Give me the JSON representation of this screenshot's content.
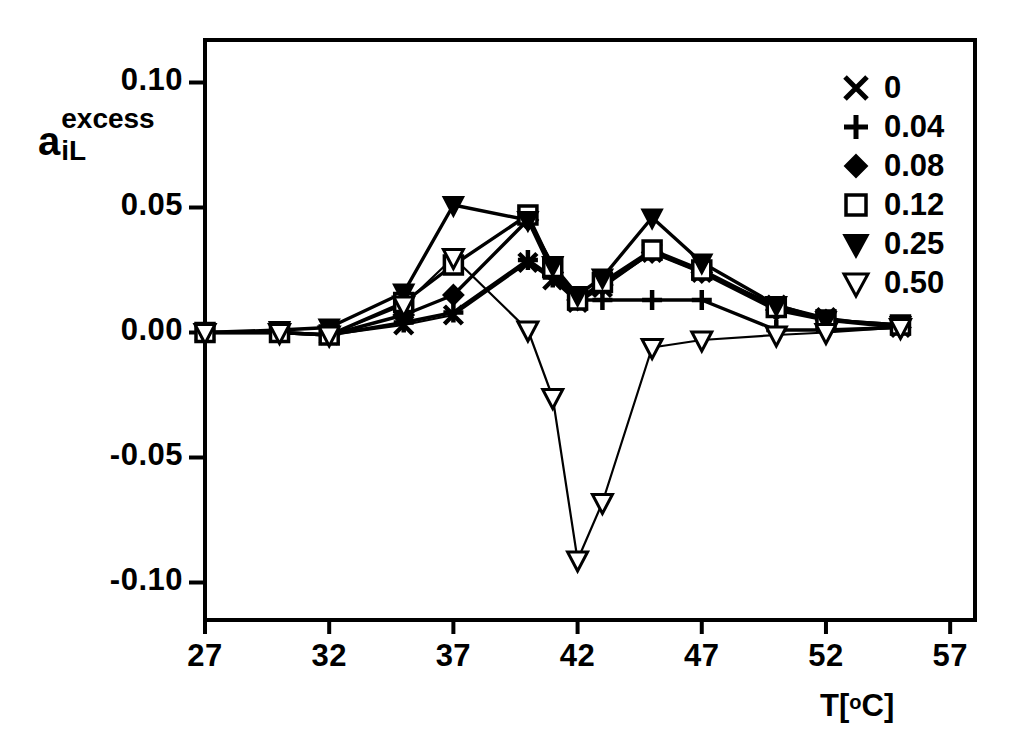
{
  "chart_data": {
    "type": "line",
    "title": "",
    "subtitle": "",
    "xlabel": "T[°C]",
    "ylabel": "a_iL^excess",
    "ylabel_parts": {
      "base": "a",
      "superscript": "excess",
      "subscript": "iL"
    },
    "xlim": [
      27,
      58
    ],
    "ylim": [
      -0.115,
      0.117
    ],
    "xticks": [
      27,
      32,
      37,
      42,
      47,
      52,
      57
    ],
    "xtick_labels": [
      "27",
      "32",
      "37",
      "42",
      "47",
      "52",
      "57"
    ],
    "yticks": [
      0.1,
      0.05,
      0.0,
      -0.05,
      -0.1
    ],
    "ytick_labels": [
      "0.10",
      "0.05",
      "0.00",
      "-0.05",
      "-0.10"
    ],
    "grid": false,
    "legend_position": "top-right",
    "legend_title": "",
    "series": [
      {
        "name": "0",
        "marker": "x",
        "marker_filled": true,
        "x": [
          27,
          30,
          32,
          35,
          37,
          40,
          41,
          42,
          43,
          45,
          47,
          50,
          52,
          55
        ],
        "y": [
          0.0,
          0.0,
          -0.001,
          0.003,
          0.007,
          0.028,
          0.021,
          0.012,
          0.018,
          0.032,
          0.024,
          0.011,
          0.006,
          0.002
        ]
      },
      {
        "name": "0.04",
        "marker": "plus",
        "marker_filled": true,
        "x": [
          27,
          30,
          32,
          35,
          37,
          40,
          41,
          42,
          43,
          45,
          47,
          50,
          52,
          55
        ],
        "y": [
          0.0,
          0.0,
          -0.001,
          0.004,
          0.008,
          0.029,
          0.022,
          0.013,
          0.013,
          0.013,
          0.013,
          0.001,
          0.001,
          0.002
        ]
      },
      {
        "name": "0.08",
        "marker": "diamond",
        "marker_filled": true,
        "x": [
          27,
          30,
          32,
          35,
          37,
          40,
          41,
          42,
          43,
          45,
          47,
          50,
          52,
          55
        ],
        "y": [
          0.0,
          0.0,
          -0.001,
          0.007,
          0.015,
          0.045,
          0.024,
          0.013,
          0.019,
          0.032,
          0.024,
          0.009,
          0.005,
          0.002
        ]
      },
      {
        "name": "0.12",
        "marker": "square-open",
        "marker_filled": false,
        "x": [
          27,
          30,
          32,
          35,
          37,
          40,
          41,
          42,
          43,
          45,
          47,
          50,
          52,
          55
        ],
        "y": [
          0.0,
          0.0,
          -0.001,
          0.012,
          0.027,
          0.047,
          0.026,
          0.013,
          0.02,
          0.033,
          0.025,
          0.01,
          0.005,
          0.003
        ]
      },
      {
        "name": "0.25",
        "marker": "triangle-down",
        "marker_filled": true,
        "x": [
          27,
          30,
          32,
          35,
          37,
          40,
          41,
          42,
          43,
          45,
          47,
          50,
          52,
          55
        ],
        "y": [
          0.0,
          0.001,
          0.002,
          0.016,
          0.051,
          0.045,
          0.027,
          0.015,
          0.022,
          0.046,
          0.028,
          0.011,
          0.005,
          0.003
        ]
      },
      {
        "name": "0.50",
        "marker": "triangle-down-open",
        "marker_filled": false,
        "x": [
          27,
          30,
          32,
          35,
          37,
          40,
          41,
          42,
          43,
          45,
          47,
          50,
          52,
          55
        ],
        "y": [
          0.0,
          0.0,
          -0.001,
          0.011,
          0.03,
          0.001,
          -0.026,
          -0.091,
          -0.068,
          -0.006,
          -0.003,
          -0.001,
          0.0,
          0.002
        ]
      }
    ]
  },
  "axes": {
    "x_tick_labels": [
      "27",
      "32",
      "37",
      "42",
      "47",
      "52",
      "57"
    ],
    "y_tick_labels": [
      "0.10",
      "0.05",
      "0.00",
      "-0.05",
      "-0.10"
    ],
    "x_axis_title": "T",
    "x_axis_unit_open": "[",
    "x_axis_unit_deg": "o",
    "x_axis_unit_c": "C",
    "x_axis_unit_close": "]",
    "y_axis_base": "a",
    "y_axis_superscript": "excess",
    "y_axis_subscript": "iL"
  },
  "legend": {
    "entries": [
      {
        "label": "0",
        "marker": "x-marker"
      },
      {
        "label": "0.04",
        "marker": "plus-marker"
      },
      {
        "label": "0.08",
        "marker": "filled-diamond-marker"
      },
      {
        "label": "0.12",
        "marker": "open-square-marker"
      },
      {
        "label": "0.25",
        "marker": "filled-triangle-down-marker"
      },
      {
        "label": "0.50",
        "marker": "open-triangle-down-marker"
      }
    ]
  },
  "style": {
    "line_color": "#000000",
    "background": "#ffffff",
    "frame_color": "#000000"
  }
}
